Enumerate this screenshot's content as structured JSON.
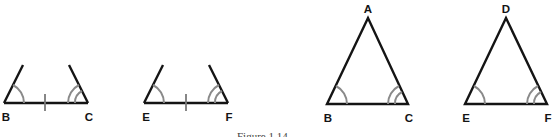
{
  "figure": {
    "caption": "Figure 1.14"
  },
  "panels": [
    {
      "id": "partial-bc",
      "description": "Segment BC with angle marks at B (single arc) and C (double arc), tick mark on BC",
      "vertices": [
        {
          "label": "B",
          "x": 4,
          "y": 103
        },
        {
          "label": "C",
          "x": 88,
          "y": 103
        }
      ],
      "labels": {
        "first": "B",
        "second": "C"
      }
    },
    {
      "id": "partial-ef",
      "description": "Segment EF with angle marks at E (single arc) and F (double arc), tick mark on EF",
      "vertices": [
        {
          "label": "E",
          "x": 144,
          "y": 103
        },
        {
          "label": "F",
          "x": 228,
          "y": 103
        }
      ],
      "labels": {
        "first": "E",
        "second": "F"
      }
    },
    {
      "id": "triangle-abc",
      "description": "Triangle ABC with single arc at B and double arc at C",
      "vertices": [
        {
          "label": "A",
          "x": 368,
          "y": 18
        },
        {
          "label": "B",
          "x": 327,
          "y": 104
        },
        {
          "label": "C",
          "x": 408,
          "y": 104
        }
      ],
      "labels": {
        "apex": "A",
        "left": "B",
        "right": "C"
      }
    },
    {
      "id": "triangle-def",
      "description": "Triangle DEF with single arc at E and double arc at F",
      "vertices": [
        {
          "label": "D",
          "x": 506,
          "y": 18
        },
        {
          "label": "E",
          "x": 465,
          "y": 104
        },
        {
          "label": "F",
          "x": 547,
          "y": 104
        }
      ],
      "labels": {
        "apex": "D",
        "left": "E",
        "right": "F"
      }
    }
  ],
  "colors": {
    "edge": "#141414",
    "angle_arc": "#8a8a8a",
    "tick": "#7a7a7a",
    "background": "#ffffff"
  }
}
